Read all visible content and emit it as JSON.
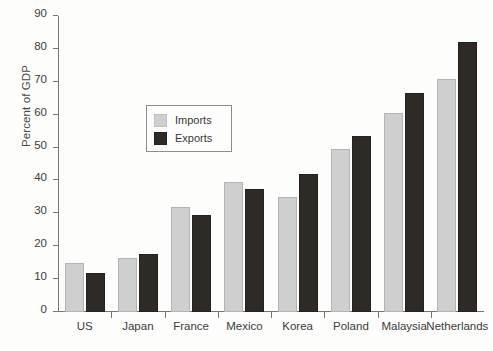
{
  "chart_data": {
    "type": "bar",
    "title": "",
    "xlabel": "",
    "ylabel": "Percent of GDP",
    "ylim": [
      0,
      90
    ],
    "ytick_step": 10,
    "yticks": [
      0,
      10,
      20,
      30,
      40,
      50,
      60,
      70,
      80,
      90
    ],
    "grid": false,
    "legend_position": "upper-left-inside",
    "categories": [
      "US",
      "Japan",
      "France",
      "Mexico",
      "Korea",
      "Poland",
      "Malaysia",
      "Netherlands"
    ],
    "series": [
      {
        "name": "Imports",
        "color": "#cfcfcf",
        "values": [
          15,
          16.5,
          32,
          39.5,
          35,
          49.5,
          60.5,
          71
        ]
      },
      {
        "name": "Exports",
        "color": "#2e2b26",
        "values": [
          12,
          17.5,
          29.5,
          37.5,
          42,
          53.5,
          66.5,
          82
        ]
      }
    ]
  },
  "legend": {
    "items": [
      {
        "label": "Imports",
        "swatch": "legend-swatch-imports-icon"
      },
      {
        "label": "Exports",
        "swatch": "legend-swatch-exports-icon"
      }
    ]
  },
  "axes": {
    "y_title": "Percent of GDP",
    "y_labels": [
      "0",
      "10",
      "20",
      "30",
      "40",
      "50",
      "60",
      "70",
      "80",
      "90"
    ]
  }
}
